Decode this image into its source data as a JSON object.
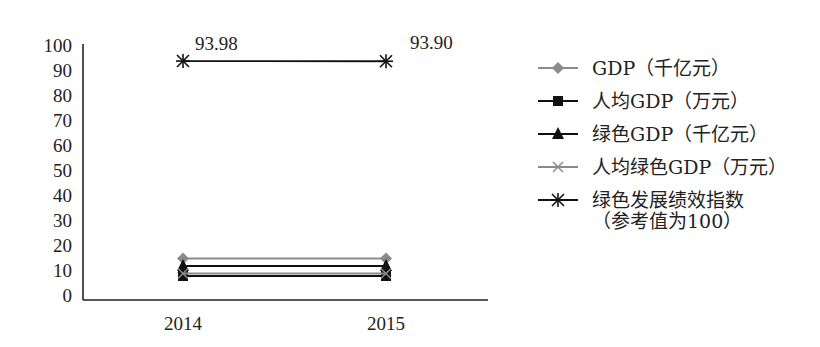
{
  "chart_data": {
    "type": "line",
    "title": "",
    "xlabel": "",
    "ylabel": "",
    "categories": [
      "2014",
      "2015"
    ],
    "ylim": [
      0,
      100
    ],
    "yticks": [
      0,
      10,
      20,
      30,
      40,
      50,
      60,
      70,
      80,
      90,
      100
    ],
    "grid": false,
    "legend_position": "right",
    "series": [
      {
        "name": "GDP（千亿元）",
        "values": [
          15,
          15
        ],
        "marker": "diamond",
        "color": "#8a8a8a"
      },
      {
        "name": "人均GDP（万元）",
        "values": [
          8,
          8
        ],
        "marker": "square",
        "color": "#111111"
      },
      {
        "name": "绿色GDP（千亿元）",
        "values": [
          12,
          12
        ],
        "marker": "triangle",
        "color": "#111111"
      },
      {
        "name": "人均绿色GDP（万元）",
        "values": [
          9,
          9
        ],
        "marker": "x",
        "color": "#8a8a8a"
      },
      {
        "name": "绿色发展绩效指数\n（参考值为100）",
        "values": [
          93.98,
          93.9
        ],
        "marker": "star",
        "color": "#111111"
      }
    ],
    "annotations": [
      {
        "text": "93.98",
        "category": "2014",
        "series": 4
      },
      {
        "text": "93.90",
        "category": "2015",
        "series": 4
      }
    ]
  }
}
